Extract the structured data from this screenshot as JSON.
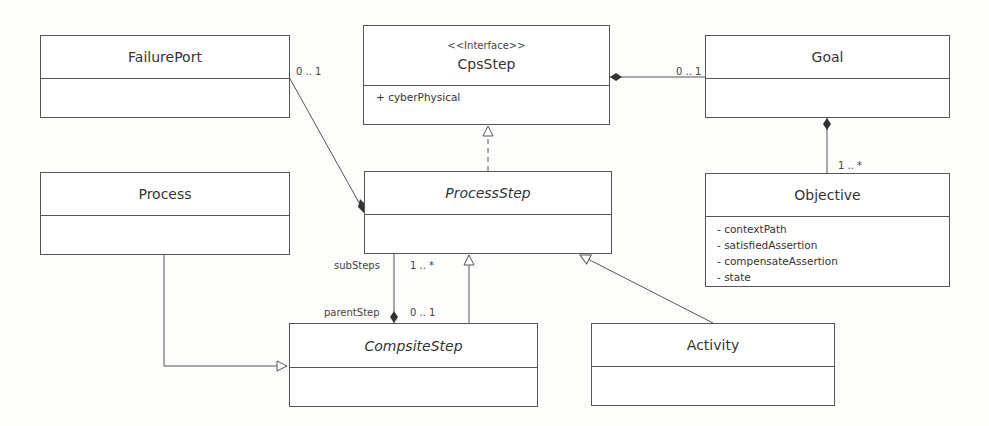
{
  "classes": {
    "failure_port": {
      "name": "FailurePort"
    },
    "cps_step": {
      "stereotype": "<<Interface>>",
      "name": "CpsStep",
      "attributes": [
        "+ cyberPhysical"
      ]
    },
    "goal": {
      "name": "Goal"
    },
    "process": {
      "name": "Process"
    },
    "process_step": {
      "name": "ProcessStep"
    },
    "objective": {
      "name": "Objective",
      "attributes": [
        "- contextPath",
        "- satisfiedAssertion",
        "- compensateAssertion",
        "- state"
      ]
    },
    "compsite_step": {
      "name": "CompsiteStep"
    },
    "activity": {
      "name": "Activity"
    }
  },
  "relations": {
    "failureport_processstep": {
      "multiplicity": "0 .. 1"
    },
    "cpsstep_goal": {
      "multiplicity": "0 .. 1"
    },
    "goal_objective": {
      "multiplicity": "1 .. *"
    },
    "processstep_compsite": {
      "role_top": "subSteps",
      "mult_top": "1 .. *",
      "role_bottom": "parentStep",
      "mult_bottom": "0 .. 1"
    }
  }
}
